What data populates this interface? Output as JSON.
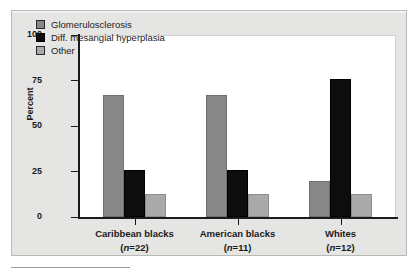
{
  "chart_data": {
    "type": "bar",
    "title": "",
    "xlabel": "",
    "ylabel": "Percent",
    "ylim": [
      0,
      100
    ],
    "yticks": [
      0,
      25,
      50,
      75,
      100
    ],
    "grid": false,
    "legend_position": "top-left",
    "categories": [
      "Caribbean blacks",
      "American blacks",
      "Whites"
    ],
    "category_counts": [
      "(n=22)",
      "(n=11)",
      "(n=12)"
    ],
    "series": [
      {
        "name": "Glomerulosclerosis",
        "color": "#878787",
        "values": [
          67,
          67,
          20
        ]
      },
      {
        "name": "Diff. mesangial hyperplasia",
        "color": "#0d0d0d",
        "values": [
          26,
          26,
          76
        ]
      },
      {
        "name": "Other",
        "color": "#a9a9a9",
        "values": [
          12.5,
          12.5,
          12.5
        ]
      }
    ]
  },
  "axis": {
    "y_title": "Percent",
    "y_tick_labels": [
      "100",
      "75",
      "50",
      "25",
      "0"
    ]
  },
  "legend": {
    "items": [
      {
        "label": "Glomerulosclerosis"
      },
      {
        "label": "Diff. mesangial hyperplasia"
      },
      {
        "label": "Other"
      }
    ]
  },
  "x_groups": [
    {
      "label": "Caribbean blacks",
      "n_prefix": "(",
      "n_italic": "n",
      "n_suffix": "=22)"
    },
    {
      "label": "American blacks",
      "n_prefix": "(",
      "n_italic": "n",
      "n_suffix": "=11)"
    },
    {
      "label": "Whites",
      "n_prefix": "(",
      "n_italic": "n",
      "n_suffix": "=12)"
    }
  ]
}
